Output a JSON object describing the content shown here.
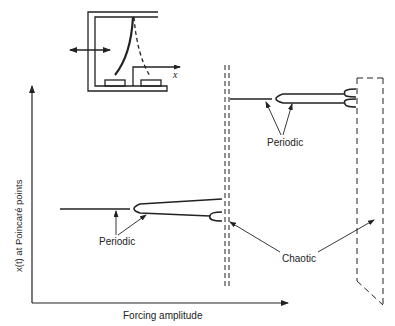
{
  "diagram": {
    "type": "bifurcation-schematic",
    "inset": {
      "description": "forced buckled beam between two magnets",
      "x_axis_label": "x",
      "forcing_arrow": "double-headed horizontal arrow"
    },
    "axes": {
      "y_label": "x(t) at Poincaré points",
      "x_label": "Forcing amplitude"
    },
    "annotations": {
      "periodic_lower": "Periodic",
      "periodic_upper": "Periodic",
      "chaotic": "Chaotic"
    },
    "colors": {
      "line": "#222222",
      "background": "#ffffff"
    }
  }
}
